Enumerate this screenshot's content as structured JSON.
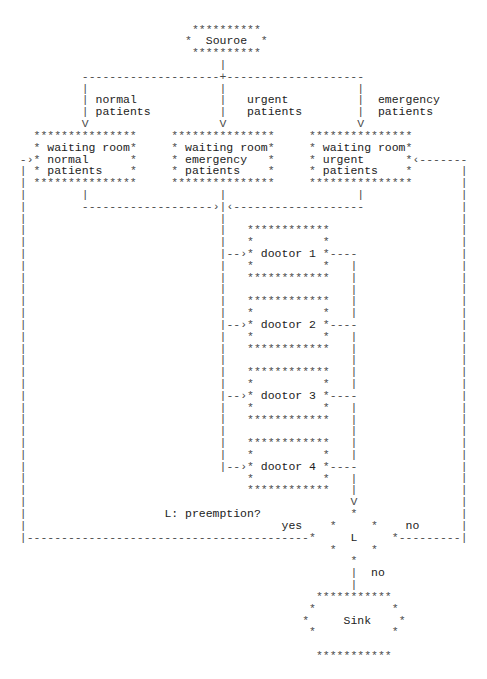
{
  "glyphs": {
    "star": "*",
    "v_line": "|",
    "h_line": "-",
    "junction": "+",
    "arrow_down": "V",
    "arrow_right": "›",
    "arrow_left": "‹"
  },
  "nodes": {
    "source": {
      "label": "Souroe"
    },
    "waiting_rooms": [
      {
        "title": "waiting room",
        "line2": "normal",
        "line3": "patients"
      },
      {
        "title": "waiting room",
        "line2": "emergency",
        "line3": "patients"
      },
      {
        "title": "waiting room",
        "line2": "urgent",
        "line3": "patients"
      }
    ],
    "doctors": [
      {
        "label": "dootor 1"
      },
      {
        "label": "dootor 2"
      },
      {
        "label": "dootor 3"
      },
      {
        "label": "dootor 4"
      }
    ],
    "decision": {
      "symbol": "L",
      "caption": "L: preemption?"
    },
    "sink": {
      "label": "Sink"
    }
  },
  "edges": {
    "source_branches": [
      {
        "line1": "normal",
        "line2": "patients"
      },
      {
        "line1": "urgent",
        "line2": "patients"
      },
      {
        "line1": "emergency",
        "line2": "patients"
      }
    ],
    "decision_yes": "yes",
    "decision_no_feedback": "no",
    "decision_no_exit": "no"
  }
}
